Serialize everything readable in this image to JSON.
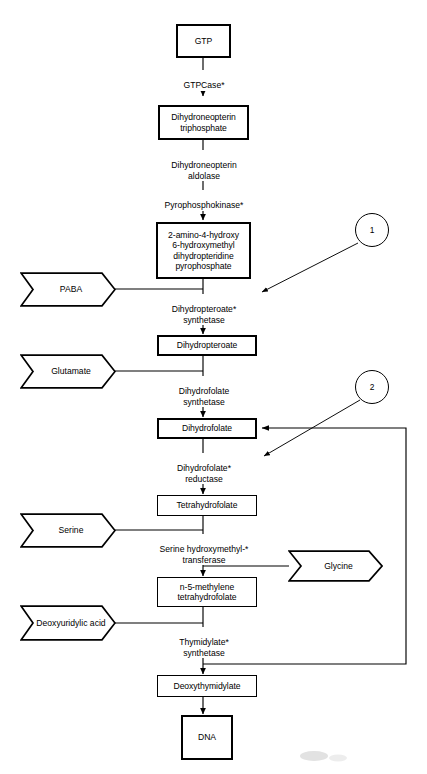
{
  "figure": {
    "top_caption": "",
    "stroke_color": "#000000",
    "background_color": "#ffffff"
  },
  "nodes": [
    {
      "id": "gtp",
      "label": "GTP",
      "shape": "box",
      "weight": "heavy"
    },
    {
      "id": "dihydroneopterin_triphosphate",
      "label": "Dihydroneopterin\ntriphosphate",
      "shape": "box",
      "weight": "heavy"
    },
    {
      "id": "amino_hydroxy_pyrophosphate",
      "label": "2-amino-4-hydroxy\n6-hydroxymethyl\ndihydropteridine\npyrophosphate",
      "shape": "box",
      "weight": "heavy"
    },
    {
      "id": "dihydropteroate",
      "label": "Dihydropteroate",
      "shape": "box",
      "weight": "heavy"
    },
    {
      "id": "dihydrofolate",
      "label": "Dihydrofolate",
      "shape": "box",
      "weight": "heavy"
    },
    {
      "id": "tetrahydrofolate",
      "label": "Tetrahydrofolate",
      "shape": "box",
      "weight": "normal"
    },
    {
      "id": "n5_methylene_tetrahydrofolate",
      "label": "n-5-methylene\ntetrahydrofolate",
      "shape": "box",
      "weight": "normal"
    },
    {
      "id": "deoxythymidylate",
      "label": "Deoxythymidylate",
      "shape": "box",
      "weight": "normal"
    },
    {
      "id": "dna",
      "label": "DNA",
      "shape": "box",
      "weight": "heavy"
    }
  ],
  "substrates": [
    {
      "id": "paba",
      "label": "PABA",
      "shape": "chevron"
    },
    {
      "id": "glutamate",
      "label": "Glutamate",
      "shape": "chevron"
    },
    {
      "id": "serine",
      "label": "Serine",
      "shape": "chevron"
    },
    {
      "id": "deoxyuridylic_acid",
      "label": "Deoxyuridylic\nacid",
      "shape": "chevron"
    }
  ],
  "products": [
    {
      "id": "glycine",
      "label": "Glycine",
      "shape": "chevron"
    }
  ],
  "enzymes": [
    {
      "id": "gtpcase",
      "label": "GTPCase*",
      "inhibited": true
    },
    {
      "id": "dihydroneopterin_aldolase",
      "label": "Dihydroneopterin\naldolase",
      "inhibited": false
    },
    {
      "id": "pyrophosphokinase",
      "label": "Pyrophosphokinase*",
      "inhibited": true
    },
    {
      "id": "dihydropteroate_synthetase",
      "label": "Dihydropteroate*\nsynthetase",
      "inhibited": true
    },
    {
      "id": "dihydrofolate_synthetase",
      "label": "Dihydrofolate\nsynthetase",
      "inhibited": false
    },
    {
      "id": "dihydrofolate_reductase",
      "label": "Dihydrofolate*\nreductase",
      "inhibited": true
    },
    {
      "id": "serine_hydroxymethyl_transferase",
      "label": "Serine hydroxymethyl-*\ntransferase",
      "inhibited": true
    },
    {
      "id": "thymidylate_synthetase",
      "label": "Thymidylate*\nsynthetase",
      "inhibited": true
    }
  ],
  "annotations": [
    {
      "id": "ref-1",
      "label": "1",
      "points_to": "dihydropteroate_synthetase"
    },
    {
      "id": "ref-2",
      "label": "2",
      "points_to": "dihydrofolate_reductase"
    }
  ]
}
